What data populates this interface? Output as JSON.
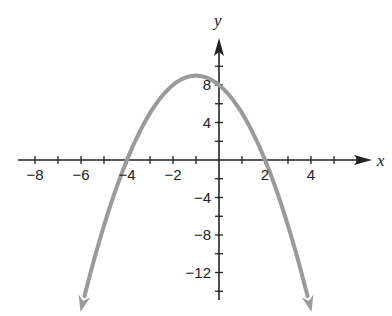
{
  "chart_data": {
    "type": "line",
    "title": "",
    "xlabel": "x",
    "ylabel": "y",
    "function": "y = -x^2 - 2x + 8",
    "xlim": [
      -9,
      6.5
    ],
    "ylim": [
      -15,
      12.5
    ],
    "grid": false,
    "x_ticks": [
      -8,
      -6,
      -4,
      -2,
      2,
      4
    ],
    "y_ticks": [
      8,
      4,
      -4,
      -8,
      -12
    ],
    "x_tick_labels": [
      "−8",
      "−6",
      "−4",
      "−2",
      "2",
      "4"
    ],
    "y_tick_labels": [
      "8",
      "4",
      "−4",
      "−8",
      "−12"
    ],
    "key_points": {
      "x_intercepts": [
        -4,
        2
      ],
      "y_intercept": 8,
      "vertex": [
        -1,
        9
      ]
    },
    "series": [
      {
        "name": "parabola",
        "color": "#9a9a9a",
        "x": [
          -6.1,
          -5,
          -4,
          -3,
          -2,
          -1,
          0,
          1,
          2,
          3,
          4.1
        ],
        "y": [
          -12.8,
          -7,
          0,
          5,
          8,
          9,
          8,
          5,
          0,
          -7,
          -15
        ]
      }
    ]
  },
  "axes": {
    "x_label": "x",
    "y_label": "y",
    "axis_color": "#222222",
    "curve_color": "#9a9a9a"
  }
}
